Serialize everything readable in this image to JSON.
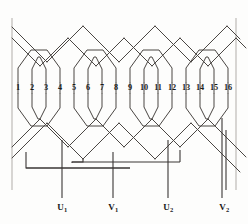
{
  "diagram": {
    "type": "winding-diagram",
    "slot_count": 16,
    "slot_numbers": [
      "1",
      "2",
      "3",
      "4",
      "5",
      "6",
      "7",
      "8",
      "9",
      "10",
      "11",
      "12",
      "13",
      "14",
      "15",
      "16"
    ],
    "slot_x": [
      18,
      32,
      46,
      60,
      74,
      88,
      102,
      116,
      130,
      144,
      158,
      172,
      186,
      200,
      214,
      228
    ],
    "groups": [
      {
        "name": "group-1",
        "slots": [
          "1",
          "2",
          "3",
          "4"
        ]
      },
      {
        "name": "group-2",
        "slots": [
          "5",
          "6",
          "7",
          "8"
        ]
      },
      {
        "name": "group-3",
        "slots": [
          "9",
          "10",
          "11",
          "12"
        ]
      },
      {
        "name": "group-4",
        "slots": [
          "13",
          "14",
          "15",
          "16"
        ]
      }
    ],
    "terminals": [
      {
        "id": "U1",
        "letter": "U",
        "index": "1",
        "x": 62,
        "lead_top": 140
      },
      {
        "id": "V1",
        "letter": "V",
        "index": "1",
        "x": 113,
        "lead_top": 152
      },
      {
        "id": "U2",
        "letter": "U",
        "index": "2",
        "x": 168,
        "lead_top": 140
      },
      {
        "id": "V2",
        "letter": "V",
        "index": "2",
        "x": 222,
        "lead_top": 118
      }
    ],
    "colors": {
      "wire": "#44403c",
      "frame": "#b8b5b0",
      "background": "#fdfdfc",
      "text": "#1a1a1a"
    },
    "frame_lines": {
      "left_x": 12,
      "right_x": 236,
      "top_y": 18,
      "bottom_y": 190
    },
    "label_y": 208,
    "numbers_y": 88
  }
}
